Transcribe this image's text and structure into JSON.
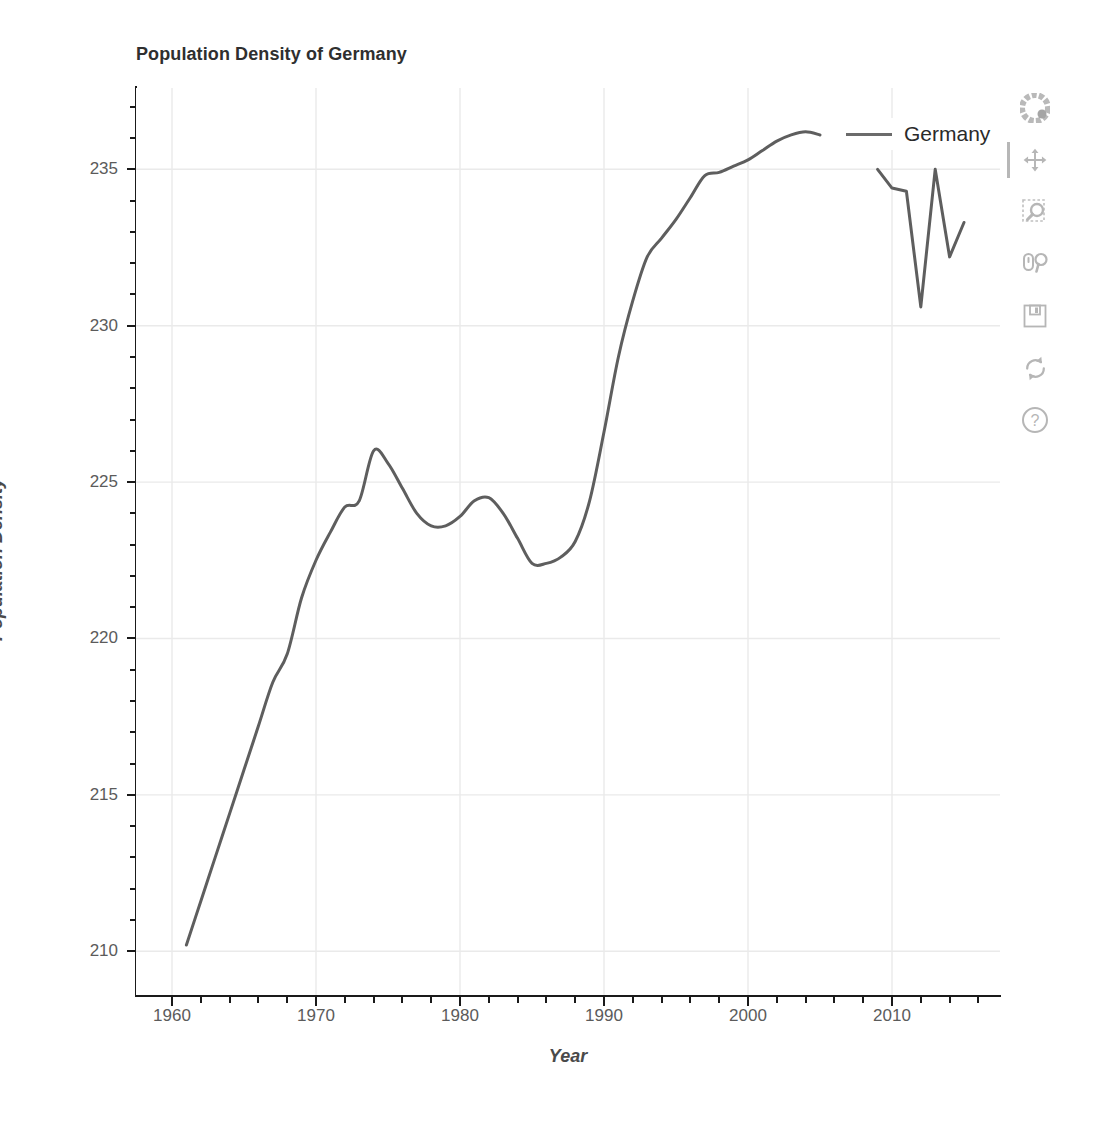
{
  "chart_data": {
    "type": "line",
    "title": "Population Density of Germany",
    "xlabel": "Year",
    "ylabel": "Population Density",
    "xlim": [
      1957.5,
      1917.5
    ],
    "x_axis_range": [
      1957.5,
      2017.5
    ],
    "ylim": [
      208.6,
      237.6
    ],
    "grid": true,
    "legend_position": "top-right",
    "legend": [
      "Germany"
    ],
    "series": [
      {
        "name": "Germany",
        "color": "#5e5e5e",
        "x": [
          1961,
          1962,
          1963,
          1964,
          1965,
          1966,
          1967,
          1968,
          1969,
          1970,
          1971,
          1972,
          1973,
          1974,
          1975,
          1976,
          1977,
          1978,
          1979,
          1980,
          1981,
          1982,
          1983,
          1984,
          1985,
          1986,
          1987,
          1988,
          1989,
          1990,
          1991,
          1992,
          1993,
          1994,
          1995,
          1996,
          1997,
          1998,
          1999,
          2000,
          2001,
          2002,
          2003,
          2004,
          2005
        ],
        "values": [
          210.2,
          211.6,
          213.0,
          214.4,
          215.8,
          217.2,
          218.6,
          219.5,
          221.3,
          222.5,
          223.4,
          224.2,
          224.4,
          226.0,
          225.6,
          224.8,
          224.0,
          223.6,
          223.6,
          223.9,
          224.4,
          224.5,
          224.0,
          223.2,
          222.4,
          222.4,
          222.6,
          223.1,
          224.4,
          226.6,
          229.0,
          230.8,
          232.2,
          232.8,
          233.4,
          234.1,
          234.8,
          234.9,
          235.1,
          235.3,
          235.6,
          235.9,
          236.1,
          236.2,
          236.1
        ]
      },
      {
        "name": "Germany",
        "color": "#5e5e5e",
        "x": [
          2009,
          2010,
          2011,
          2012,
          2013,
          2014,
          2015
        ],
        "values": [
          235.0,
          234.4,
          234.3,
          230.6,
          235.0,
          232.2,
          233.3
        ]
      }
    ],
    "x_ticks_major": [
      1960,
      1970,
      1980,
      1990,
      2000,
      2010
    ],
    "x_tick_labels": [
      "1960",
      "1970",
      "1980",
      "1990",
      "2000",
      "2010"
    ],
    "x_ticks_minor": [
      1962,
      1964,
      1966,
      1968,
      1972,
      1974,
      1976,
      1978,
      1982,
      1984,
      1986,
      1988,
      1992,
      1994,
      1996,
      1998,
      2002,
      2004,
      2006,
      2008,
      2012,
      2014,
      2016
    ],
    "y_ticks_major": [
      210,
      215,
      220,
      225,
      230,
      235
    ],
    "y_tick_labels": [
      "210",
      "215",
      "220",
      "225",
      "230",
      "235"
    ],
    "y_ticks_minor": [
      211,
      212,
      213,
      214,
      216,
      217,
      218,
      219,
      221,
      222,
      223,
      224,
      226,
      227,
      228,
      229,
      231,
      232,
      233,
      234,
      236,
      237
    ]
  },
  "colors": {
    "line": "#5e5e5e",
    "grid": "#eaeaea",
    "axis": "#1a1a1a",
    "tick_label": "#5b5b5b",
    "title": "#2f2f2f",
    "background": "#ffffff",
    "toolbar_icon": "#8a8a8a"
  },
  "toolbar": {
    "tools": [
      {
        "name": "bokeh-logo-icon",
        "label": "Bokeh",
        "active": false
      },
      {
        "name": "pan-icon",
        "label": "Pan",
        "active": true
      },
      {
        "name": "box-zoom-icon",
        "label": "Box Zoom",
        "active": false
      },
      {
        "name": "wheel-zoom-icon",
        "label": "Wheel Zoom",
        "active": false
      },
      {
        "name": "save-icon",
        "label": "Save",
        "active": false
      },
      {
        "name": "reset-icon",
        "label": "Reset",
        "active": false
      },
      {
        "name": "help-icon",
        "label": "Help",
        "active": false
      }
    ]
  }
}
